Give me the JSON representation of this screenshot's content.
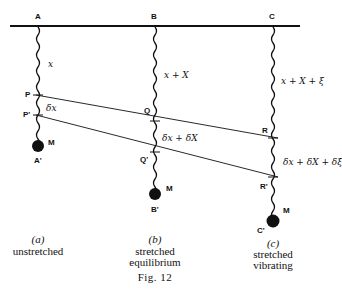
{
  "figure": {
    "caption": "Fig. 12",
    "support_labels": [
      "A",
      "B",
      "C"
    ],
    "panels": [
      {
        "id": "a",
        "label": "(a)",
        "desc": [
          "unstretched"
        ],
        "top_point": "A",
        "points": [
          "P",
          "P'"
        ],
        "mass_label": "M",
        "bottom_label": "A'",
        "length_label": "x",
        "segment_label": "δx"
      },
      {
        "id": "b",
        "label": "(b)",
        "desc": [
          "stretched",
          "equilibrium"
        ],
        "top_point": "B",
        "points": [
          "Q",
          "Q'"
        ],
        "mass_label": "M",
        "bottom_label": "B'",
        "length_label": "x + X",
        "segment_label": "δx + δX"
      },
      {
        "id": "c",
        "label": "(c)",
        "desc": [
          "stretched",
          "vibrating"
        ],
        "top_point": "C",
        "points": [
          "R",
          "R'"
        ],
        "mass_label": "M",
        "bottom_label": "C'",
        "length_label": "x + X + ξ",
        "segment_label": "δx + δX + δξ"
      }
    ]
  }
}
